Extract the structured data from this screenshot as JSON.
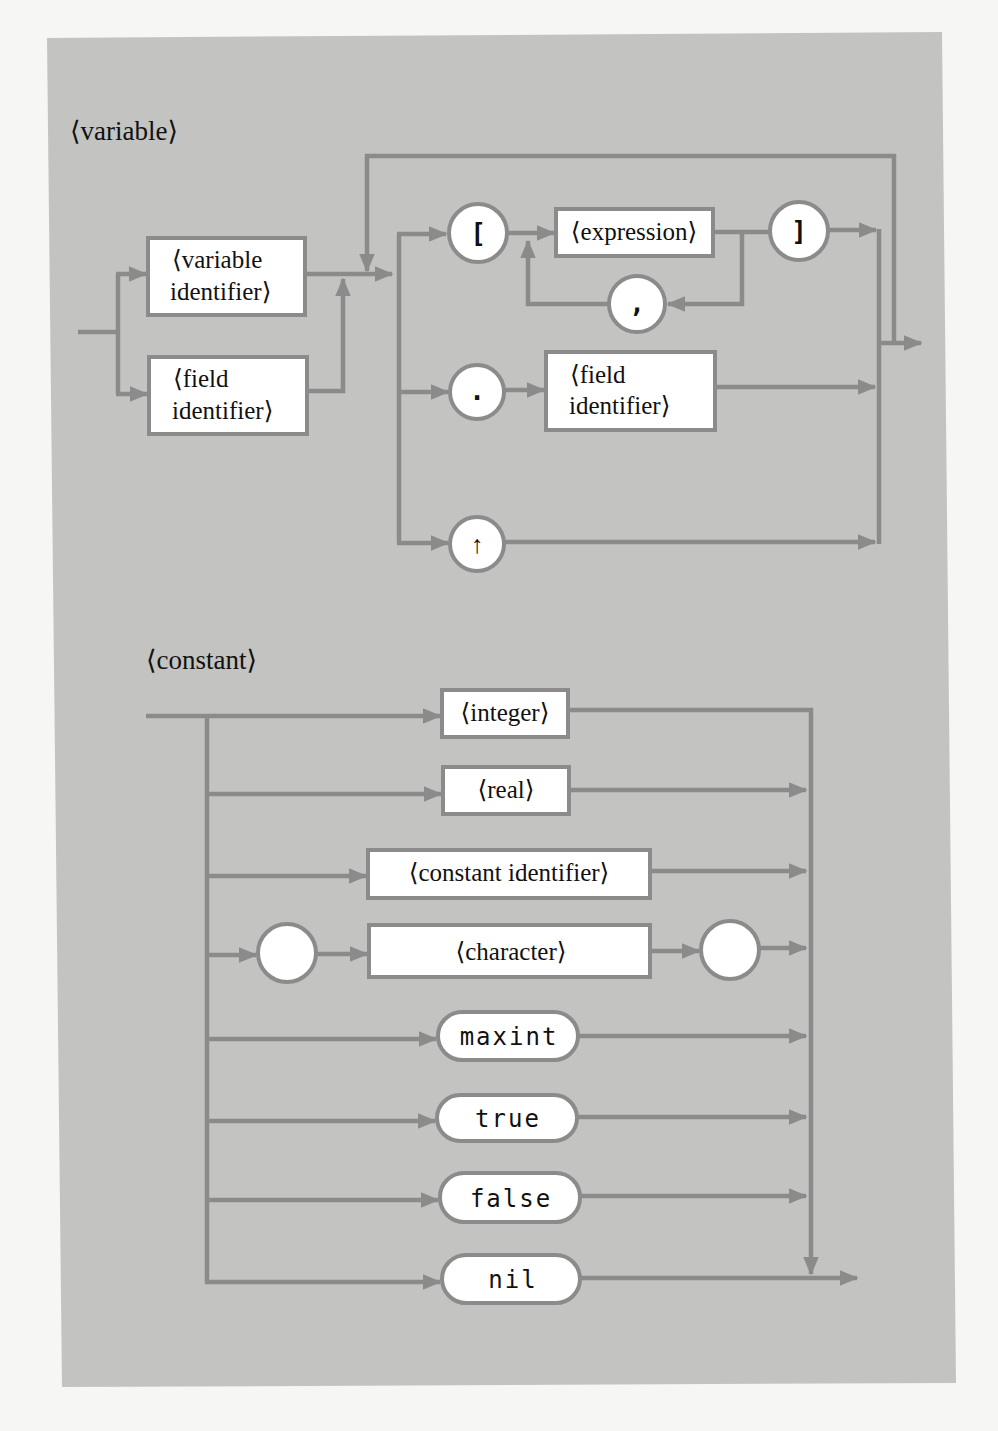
{
  "colors": {
    "page_background": "#f6f6f4",
    "panel": "#c3c3c1",
    "line": "#8b8b8b",
    "node_fill": "#ffffff",
    "text": "#111111"
  },
  "variable_diagram": {
    "title": "⟨variable⟩",
    "nodes": {
      "variable_identifier": {
        "line1": "⟨variable",
        "line2": "identifier⟩"
      },
      "field_identifier_entry": {
        "line1": "⟨field",
        "line2": "identifier⟩"
      },
      "open_bracket": "[",
      "expression": "⟨expression⟩",
      "comma": ",",
      "close_bracket": "]",
      "dot": ".",
      "field_identifier_selector": {
        "line1": "⟨field",
        "line2": "identifier⟩"
      },
      "pointer": "↑"
    }
  },
  "constant_diagram": {
    "title": "⟨constant⟩",
    "alternatives": [
      {
        "kind": "box",
        "label": "⟨integer⟩"
      },
      {
        "kind": "box",
        "label": "⟨real⟩"
      },
      {
        "kind": "box",
        "label": "⟨constant identifier⟩"
      },
      {
        "kind": "box",
        "label": "⟨character⟩",
        "quoted": true
      },
      {
        "kind": "keyword",
        "label": "maxint"
      },
      {
        "kind": "keyword",
        "label": "true"
      },
      {
        "kind": "keyword",
        "label": "false"
      },
      {
        "kind": "keyword",
        "label": "nil"
      }
    ],
    "quote_circle_left": "",
    "quote_circle_right": ""
  }
}
